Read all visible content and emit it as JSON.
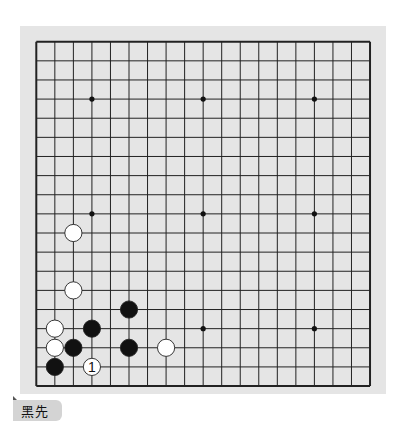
{
  "board": {
    "size": 19,
    "background": "#e5e5e5",
    "line_color": "#222222",
    "grid": {
      "left": 16.3,
      "top": 15.7,
      "dx": 18.54,
      "dy": 19.13
    },
    "star_points": [
      [
        3,
        3
      ],
      [
        9,
        3
      ],
      [
        15,
        3
      ],
      [
        3,
        9
      ],
      [
        9,
        9
      ],
      [
        15,
        9
      ],
      [
        3,
        15
      ],
      [
        9,
        15
      ],
      [
        15,
        15
      ]
    ],
    "stones": [
      {
        "color": "white",
        "col": 2,
        "row": 10
      },
      {
        "color": "white",
        "col": 2,
        "row": 13
      },
      {
        "color": "black",
        "col": 5,
        "row": 14
      },
      {
        "color": "white",
        "col": 1,
        "row": 15
      },
      {
        "color": "black",
        "col": 3,
        "row": 15
      },
      {
        "color": "white",
        "col": 1,
        "row": 16
      },
      {
        "color": "black",
        "col": 2,
        "row": 16
      },
      {
        "color": "black",
        "col": 5,
        "row": 16
      },
      {
        "color": "white",
        "col": 7,
        "row": 16
      },
      {
        "color": "black",
        "col": 1,
        "row": 17
      },
      {
        "color": "white",
        "col": 3,
        "row": 17,
        "label": "1"
      }
    ]
  },
  "caption": {
    "label": "黑先"
  }
}
